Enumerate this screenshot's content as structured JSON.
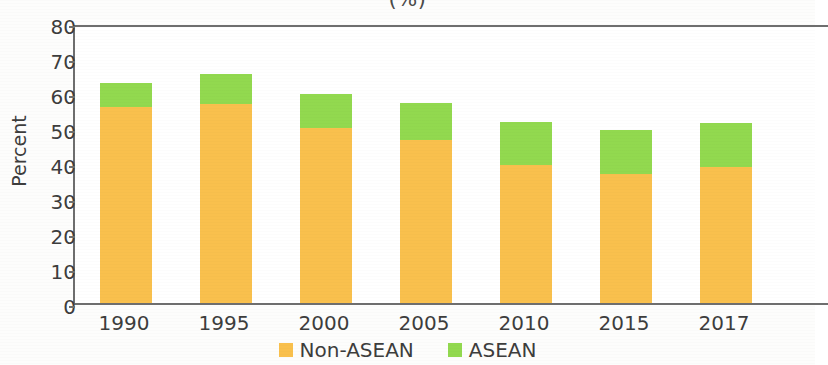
{
  "chart_data": {
    "type": "bar",
    "subtype": "stacked-bar",
    "title": "(%)",
    "xlabel": "",
    "ylabel": "Percent",
    "ylim": [
      0,
      80
    ],
    "ytick_step": 10,
    "yticks": [
      0,
      10,
      20,
      30,
      40,
      50,
      60,
      70,
      80
    ],
    "grid": false,
    "legend_position": "bottom-center",
    "categories": [
      "1990",
      "1995",
      "2000",
      "2005",
      "2010",
      "2015",
      "2017"
    ],
    "series": [
      {
        "name": "Non-ASEAN",
        "color": "#f9c04d",
        "values": [
          56.0,
          57.0,
          50.0,
          46.5,
          39.5,
          37.0,
          39.0
        ]
      },
      {
        "name": "ASEAN",
        "color": "#92d94f",
        "values": [
          7.0,
          8.5,
          9.7,
          10.7,
          12.3,
          12.3,
          12.4
        ]
      }
    ],
    "totals": [
      63.0,
      65.5,
      59.7,
      57.2,
      51.8,
      49.3,
      51.4
    ]
  },
  "axes": {
    "y_label": "Percent",
    "y_tick_labels": [
      "80",
      "70",
      "60",
      "50",
      "40",
      "30",
      "20",
      "10",
      "0"
    ],
    "x_tick_labels": [
      "1990",
      "1995",
      "2000",
      "2005",
      "2010",
      "2015",
      "2017"
    ]
  },
  "legend": {
    "items": [
      {
        "label": "Non-ASEAN",
        "color": "#f9c04d",
        "swatch": "square-swatch"
      },
      {
        "label": "ASEAN",
        "color": "#92d94f",
        "swatch": "square-swatch"
      }
    ]
  },
  "colors": {
    "non_asean": "#f9c04d",
    "asean": "#92d94f",
    "axis": "#6e6e6e",
    "text": "#3d3d3d",
    "background": "#ffffff"
  }
}
